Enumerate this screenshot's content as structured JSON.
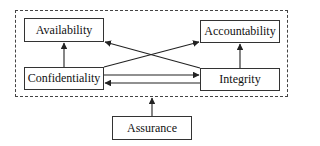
{
  "diagram": {
    "nodes": {
      "availability": "Availability",
      "accountability": "Accountability",
      "confidentiality": "Confidentiality",
      "integrity": "Integrity",
      "assurance": "Assurance"
    },
    "edges": [
      {
        "from": "Confidentiality",
        "to": "Availability"
      },
      {
        "from": "Integrity",
        "to": "Accountability"
      },
      {
        "from": "Confidentiality",
        "to": "Accountability"
      },
      {
        "from": "Integrity",
        "to": "Availability"
      },
      {
        "from": "Confidentiality",
        "to": "Integrity"
      },
      {
        "from": "Integrity",
        "to": "Confidentiality"
      },
      {
        "from": "Assurance",
        "to": "group"
      }
    ],
    "colors": {
      "line": "#222222",
      "background": "#ffffff"
    }
  }
}
